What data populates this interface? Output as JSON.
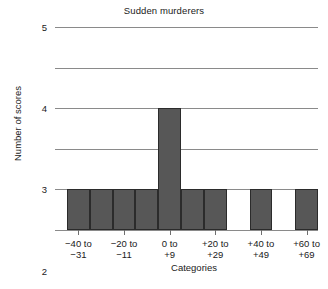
{
  "chart_data": {
    "type": "bar",
    "title": "Sudden murderers",
    "xlabel": "Categories",
    "ylabel": "Number of scores",
    "ylim": [
      0,
      5
    ],
    "yticks": [
      "0",
      "1",
      "2",
      "3",
      "4",
      "5"
    ],
    "ytick_values": [
      0,
      1,
      2,
      3,
      4,
      5
    ],
    "grid": "horizontal",
    "legend": "none",
    "bar_color": "#575757",
    "bar_edge_color": "#2b2b2b",
    "grid_color": "#8a8a8a",
    "categories": [
      "-40 to -31",
      "-30 to -21",
      "-20 to -11",
      "-10 to -1",
      "0 to +9",
      "+10 to +19",
      "+20 to +29",
      "+30 to +39",
      "+40 to +49",
      "+50 to +59",
      "+60 to +69"
    ],
    "values": [
      1,
      1,
      1,
      1,
      3,
      1,
      1,
      0,
      1,
      0,
      1
    ],
    "xtick_labels": [
      {
        "line1": "−40 to",
        "line2": "−31"
      },
      {
        "line1": "−20 to",
        "line2": "−11"
      },
      {
        "line1": "0 to",
        "line2": "+9"
      },
      {
        "line1": "+20 to",
        "line2": "+29"
      },
      {
        "line1": "+40 to",
        "line2": "+49"
      },
      {
        "line1": "+60 to",
        "line2": "+69"
      }
    ]
  }
}
